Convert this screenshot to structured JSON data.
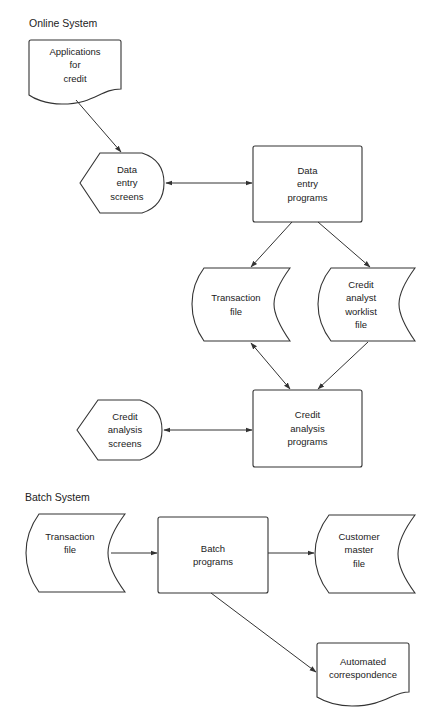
{
  "sections": {
    "online": {
      "title": "Online System"
    },
    "batch": {
      "title": "Batch System"
    }
  },
  "nodes": {
    "applications_for_credit": {
      "type": "document",
      "lines": [
        "Applications",
        "for",
        "credit"
      ]
    },
    "data_entry_screens": {
      "type": "display",
      "lines": [
        "Data",
        "entry",
        "screens"
      ]
    },
    "data_entry_programs": {
      "type": "process",
      "lines": [
        "Data",
        "entry",
        "programs"
      ]
    },
    "transaction_file_online": {
      "type": "stored-data",
      "lines": [
        "Transaction",
        "file"
      ]
    },
    "credit_analyst_worklist_file": {
      "type": "stored-data",
      "lines": [
        "Credit",
        "analyst",
        "worklist",
        "file"
      ]
    },
    "credit_analysis_screens": {
      "type": "display",
      "lines": [
        "Credit",
        "analysis",
        "screens"
      ]
    },
    "credit_analysis_programs": {
      "type": "process",
      "lines": [
        "Credit",
        "analysis",
        "programs"
      ]
    },
    "transaction_file_batch": {
      "type": "stored-data",
      "lines": [
        "Transaction",
        "file"
      ]
    },
    "batch_programs": {
      "type": "process",
      "lines": [
        "Batch",
        "programs"
      ]
    },
    "customer_master_file": {
      "type": "stored-data",
      "lines": [
        "Customer",
        "master",
        "file"
      ]
    },
    "automated_correspondence": {
      "type": "document",
      "lines": [
        "Automated",
        "correspondence"
      ]
    }
  },
  "edges": [
    {
      "from": "applications_for_credit",
      "to": "data_entry_screens",
      "direction": "forward"
    },
    {
      "from": "data_entry_screens",
      "to": "data_entry_programs",
      "direction": "both"
    },
    {
      "from": "data_entry_programs",
      "to": "transaction_file_online",
      "direction": "forward"
    },
    {
      "from": "data_entry_programs",
      "to": "credit_analyst_worklist_file",
      "direction": "forward"
    },
    {
      "from": "transaction_file_online",
      "to": "credit_analysis_programs",
      "direction": "both"
    },
    {
      "from": "credit_analyst_worklist_file",
      "to": "credit_analysis_programs",
      "direction": "forward"
    },
    {
      "from": "credit_analysis_screens",
      "to": "credit_analysis_programs",
      "direction": "both"
    },
    {
      "from": "transaction_file_batch",
      "to": "batch_programs",
      "direction": "forward"
    },
    {
      "from": "batch_programs",
      "to": "customer_master_file",
      "direction": "forward"
    },
    {
      "from": "batch_programs",
      "to": "automated_correspondence",
      "direction": "forward"
    }
  ],
  "colors": {
    "stroke": "#333333",
    "background": "#ffffff",
    "text": "#222222"
  }
}
